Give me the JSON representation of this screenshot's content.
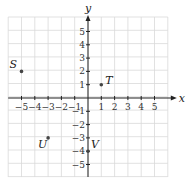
{
  "figure": {
    "x_axis_label": "x",
    "y_axis_label": "y",
    "x_range": [
      -6,
      6
    ],
    "y_range": [
      -6,
      6
    ],
    "x_ticks": [
      "−5",
      "−4",
      "−3",
      "−2",
      "−1",
      "1",
      "2",
      "3",
      "4",
      "5"
    ],
    "y_ticks": [
      "5",
      "4",
      "3",
      "2",
      "1",
      "−1",
      "−2",
      "−3",
      "−4",
      "−5"
    ],
    "grid_color": "#d9d9d9",
    "axis_color": "#222222",
    "point_color": "#444444"
  },
  "points": [
    {
      "label": "S",
      "x": -5,
      "y": 2
    },
    {
      "label": "T",
      "x": 1,
      "y": 1
    },
    {
      "label": "U",
      "x": -3,
      "y": -3
    },
    {
      "label": "V",
      "x": 0,
      "y": -4
    }
  ]
}
